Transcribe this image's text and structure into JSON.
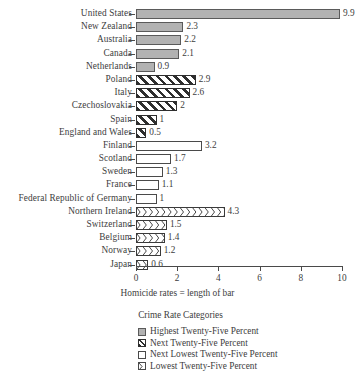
{
  "chart_data": {
    "type": "bar",
    "orientation": "horizontal",
    "title": "",
    "xlabel": "Homicide rates = length of bar",
    "ylabel": "",
    "xlim": [
      0,
      10
    ],
    "xticks": [
      0,
      2,
      4,
      6,
      8,
      10
    ],
    "xtick_labels": [
      "0",
      "2",
      "4",
      "6",
      "8",
      "10"
    ],
    "grid": false,
    "categories": [
      "United States",
      "New Zealand",
      "Australia",
      "Canada",
      "Netherlands",
      "Poland",
      "Italy",
      "Czechoslovakia",
      "Spain",
      "England and Wales",
      "Finland",
      "Scotland",
      "Sweden",
      "France",
      "Federal Republic of Germany",
      "Northern Ireland",
      "Switzerland",
      "Belgium",
      "Norway",
      "Japan"
    ],
    "values": [
      9.9,
      2.3,
      2.2,
      2.1,
      0.9,
      2.9,
      2.6,
      2,
      1,
      0.5,
      3.2,
      1.7,
      1.3,
      1.1,
      1,
      4.3,
      1.5,
      1.4,
      1.2,
      0.6
    ],
    "value_labels": [
      "9.9",
      "2.3",
      "2.2",
      "2.1",
      "0.9",
      "2.9",
      "2.6",
      "2",
      "1",
      "0.5",
      "3.2",
      "1.7",
      "1.3",
      "1.1",
      "1",
      "4.3",
      "1.5",
      "1.4",
      "1.2",
      "0.6"
    ],
    "series_group": [
      "highest",
      "highest",
      "highest",
      "highest",
      "highest",
      "next",
      "next",
      "next",
      "next",
      "next",
      "nextlowest",
      "nextlowest",
      "nextlowest",
      "nextlowest",
      "nextlowest",
      "lowest",
      "lowest",
      "lowest",
      "lowest",
      "lowest"
    ]
  },
  "legend": {
    "title": "Crime Rate Categories",
    "position": "bottom-center",
    "items": [
      {
        "key": "highest",
        "label": "Highest Twenty-Five Percent"
      },
      {
        "key": "next",
        "label": "Next Twenty-Five Percent"
      },
      {
        "key": "nextlowest",
        "label": "Next Lowest Twenty-Five Percent"
      },
      {
        "key": "lowest",
        "label": "Lowest Twenty-Five Percent"
      }
    ]
  },
  "colors": {
    "highest_fill": "#b2b2b2",
    "hatch_stroke": "#2e2e2e",
    "outline": "#4a4a4a",
    "text": "#3d3d3d",
    "background": "#ffffff"
  }
}
